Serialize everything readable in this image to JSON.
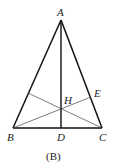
{
  "figure": {
    "caption": "(B)",
    "points": {
      "A": {
        "label": "A",
        "x": 61,
        "y": 20
      },
      "B": {
        "label": "B",
        "x": 13,
        "y": 128
      },
      "C": {
        "label": "C",
        "x": 102,
        "y": 128
      },
      "D": {
        "label": "D",
        "x": 61,
        "y": 128
      },
      "E": {
        "label": "E",
        "x": 91,
        "y": 97
      },
      "H": {
        "label": "H",
        "x": 61,
        "y": 108
      },
      "F": {
        "x": 28,
        "y": 93
      }
    },
    "segments": [
      {
        "name": "AB",
        "weight": "thick"
      },
      {
        "name": "AC",
        "weight": "thick"
      },
      {
        "name": "BC",
        "weight": "thick"
      },
      {
        "name": "AD",
        "weight": "thick"
      },
      {
        "name": "BE",
        "weight": "thin"
      },
      {
        "name": "CF",
        "weight": "thin"
      }
    ]
  }
}
